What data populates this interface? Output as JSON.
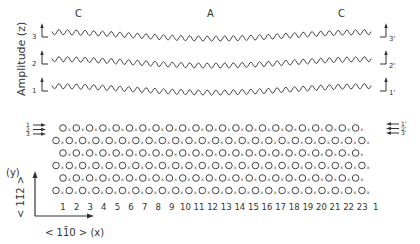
{
  "top_panel": {
    "y_axis_label": "Amplitude (z)",
    "region_labels": [
      {
        "text": "C",
        "x": 75
      },
      {
        "text": "A",
        "x": 207
      },
      {
        "text": "C",
        "x": 338
      }
    ],
    "waves": [
      {
        "left_label": "3",
        "right_label": "3'",
        "baseline_y": 35
      },
      {
        "left_label": "2",
        "right_label": "2'",
        "baseline_y": 62
      },
      {
        "left_label": "1",
        "right_label": "1'",
        "baseline_y": 89
      }
    ]
  },
  "bottom_panel": {
    "left_arrow_labels": [
      "1",
      "2",
      "3"
    ],
    "right_arrow_labels": [
      "1'",
      "2'",
      "3'"
    ],
    "column_numbers": [
      "1",
      "2",
      "3",
      "4",
      "5",
      "6",
      "7",
      "8",
      "9",
      "10",
      "11",
      "12",
      "13",
      "14",
      "15",
      "16",
      "17",
      "18",
      "19",
      "20",
      "21",
      "22",
      "23",
      "1"
    ],
    "y_axis": {
      "label": "(y)",
      "direction": "< 11̄2 >"
    },
    "x_axis": {
      "label": "< 11̄0 >  (x)"
    },
    "row_count": 6,
    "atom_symbol": "circle",
    "interstitial_symbol": "x"
  }
}
